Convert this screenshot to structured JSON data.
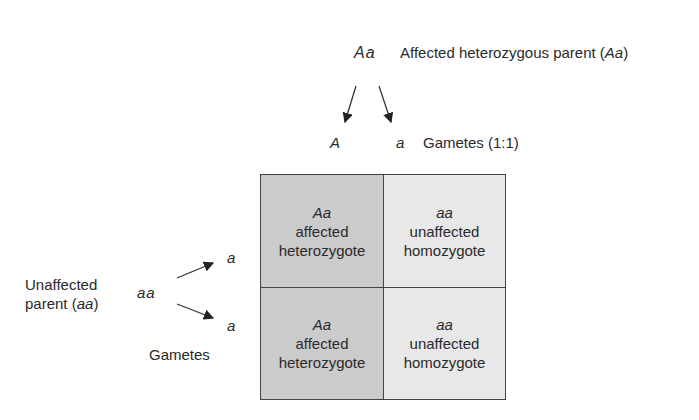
{
  "top_parent": {
    "genotype": "Aa",
    "label_prefix": "Affected heterozygous parent (",
    "label_geno": "Aa",
    "label_suffix": ")"
  },
  "top_gametes": {
    "allele1": "A",
    "allele2": "a",
    "label": "Gametes (1:1)"
  },
  "left_parent": {
    "label_line1": "Unaffected",
    "label_line2_prefix": "parent (",
    "label_line2_geno": "aa",
    "label_line2_suffix": ")",
    "genotype": "aa",
    "gamete1": "a",
    "gamete2": "a",
    "gametes_label": "Gametes"
  },
  "punnett": {
    "cells": [
      {
        "genotype": "Aa",
        "phenotype": "affected",
        "type": "heterozygote"
      },
      {
        "genotype": "aa",
        "phenotype": "unaffected",
        "type": "homozygote"
      },
      {
        "genotype": "Aa",
        "phenotype": "affected",
        "type": "heterozygote"
      },
      {
        "genotype": "aa",
        "phenotype": "unaffected",
        "type": "homozygote"
      }
    ]
  },
  "colors": {
    "affected_cell": "#cbcbcb",
    "unaffected_cell": "#e8e8e8",
    "border": "#444444"
  }
}
